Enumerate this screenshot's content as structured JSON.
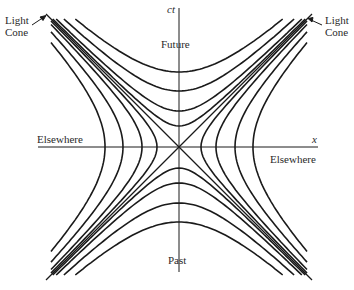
{
  "chart_data": {
    "type": "diagram",
    "axes": {
      "horizontal": {
        "label": "x"
      },
      "vertical": {
        "label": "ct"
      }
    },
    "regions": {
      "future": "Future",
      "past": "Past",
      "elsewhere_left": "Elsewhere",
      "elsewhere_right": "Elsewhere"
    },
    "light_cone": {
      "label_left": [
        "Light",
        "Cone"
      ],
      "label_right": [
        "Light",
        "Cone"
      ],
      "slope": [
        1,
        -1
      ]
    },
    "timelike_hyperbolae_vertices": [
      21,
      36,
      56,
      75
    ],
    "spacelike_hyperbolae_vertices": [
      22,
      37,
      56,
      74
    ],
    "origin_px": [
      179,
      147
    ]
  },
  "labels": {
    "ct": "ct",
    "x": "x",
    "future": "Future",
    "past": "Past",
    "elsewhere_left": "Elsewhere",
    "elsewhere_right": "Elsewhere",
    "light_left_1": "Light",
    "light_left_2": "Cone",
    "light_right_1": "Light",
    "light_right_2": "Cone"
  },
  "colors": {
    "ink": "#1a1a1a",
    "background": "#ffffff"
  }
}
